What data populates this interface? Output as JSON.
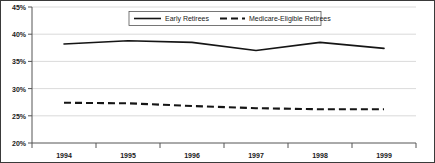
{
  "chart_data": {
    "type": "line",
    "title": "",
    "subtitle": "",
    "xlabel": "",
    "ylabel": "",
    "categories": [
      "1994",
      "1995",
      "1996",
      "1997",
      "1998",
      "1999"
    ],
    "x": [
      1994,
      1995,
      1996,
      1997,
      1998,
      1999
    ],
    "series": [
      {
        "name": "Early Retirees",
        "style": "solid",
        "color": "#151515",
        "values": [
          38.2,
          38.8,
          38.5,
          37.0,
          38.5,
          37.4
        ]
      },
      {
        "name": "Medicare-Eligible Retirees",
        "style": "dashed",
        "color": "#151515",
        "values": [
          27.4,
          27.3,
          26.8,
          26.4,
          26.2,
          26.2
        ]
      }
    ],
    "ylim": [
      20,
      45
    ],
    "y_ticks": [
      20,
      25,
      30,
      35,
      40,
      45
    ],
    "y_tick_labels": [
      "20%",
      "25%",
      "30%",
      "35%",
      "40%",
      "45%"
    ],
    "x_tick_labels": [
      "1994",
      "1995",
      "1996",
      "1997",
      "1998",
      "1999"
    ],
    "grid": true,
    "grid_axis": "y",
    "legend_position": "top-center",
    "legend_entries": [
      "Early Retirees",
      "Medicare-Eligible Retirees"
    ],
    "annotations": [],
    "colors": {
      "grid": "#d0d0d0",
      "axis": "#555555",
      "frame": "#3a3a3a",
      "text": "#1a1a1a",
      "background": "#ffffff"
    }
  },
  "legend": {
    "entry_1": "Early Retirees",
    "entry_2": "Medicare-Eligible Retirees"
  },
  "y_axis": {
    "t0": "20%",
    "t1": "25%",
    "t2": "30%",
    "t3": "35%",
    "t4": "40%",
    "t5": "45%"
  },
  "x_axis": {
    "t0": "1994",
    "t1": "1995",
    "t2": "1996",
    "t3": "1997",
    "t4": "1998",
    "t5": "1999"
  }
}
